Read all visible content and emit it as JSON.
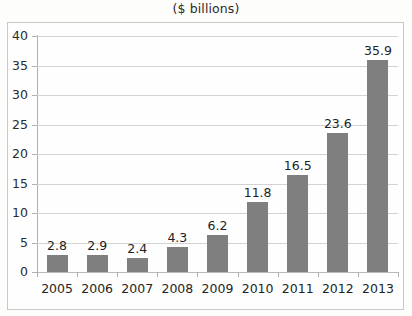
{
  "chart_data": {
    "type": "bar",
    "title": "($ billions)",
    "xlabel": "",
    "ylabel": "",
    "categories": [
      "2005",
      "2006",
      "2007",
      "2008",
      "2009",
      "2010",
      "2011",
      "2012",
      "2013"
    ],
    "values": [
      2.8,
      2.9,
      2.4,
      4.3,
      6.2,
      11.8,
      16.5,
      23.6,
      35.9
    ],
    "data_labels": [
      "2.8",
      "2.9",
      "2.4",
      "4.3",
      "6.2",
      "11.8",
      "16.5",
      "23.6",
      "35.9"
    ],
    "ylim": [
      0,
      40
    ],
    "ytick_values": [
      0,
      5,
      10,
      15,
      20,
      25,
      30,
      35,
      40
    ],
    "ytick_labels": [
      "0",
      "5",
      "10",
      "15",
      "20",
      "25",
      "30",
      "35",
      "40"
    ],
    "grid": true,
    "legend": false,
    "series_color": "#7f7f7f",
    "gridline_color": "#d3d3d1",
    "axis_color": "#b0b0ae",
    "background_color": "#fdfdfc"
  }
}
